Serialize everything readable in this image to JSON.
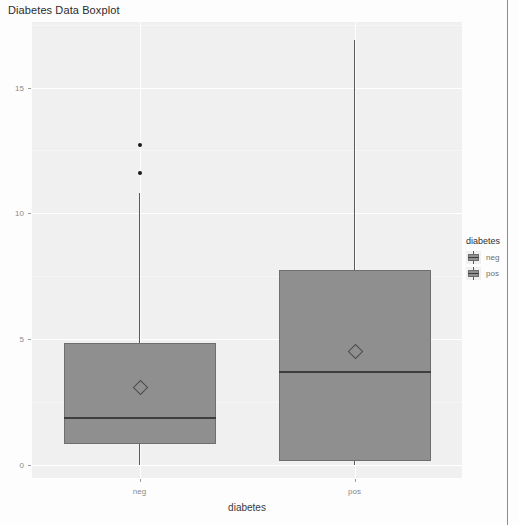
{
  "chart_data": {
    "type": "box",
    "title": "Diabetes Data Boxplot",
    "xlabel": "diabetes",
    "ylabel": "",
    "categories": [
      "neg",
      "pos"
    ],
    "ylim": [
      -0.5,
      17.6
    ],
    "yticks": [
      0,
      5,
      10,
      15
    ],
    "ytick_labels": [
      "0",
      "5",
      "10",
      "15"
    ],
    "grid": true,
    "legend": {
      "title": "diabetes",
      "position": "right",
      "entries": [
        {
          "label": "neg",
          "color": "#8f8f8f"
        },
        {
          "label": "pos",
          "color": "#8f8f8f"
        }
      ]
    },
    "series": [
      {
        "name": "neg",
        "whisker_low": 0.0,
        "q1": 0.86,
        "median": 1.9,
        "mean": 3.15,
        "q3": 4.85,
        "whisker_high": 10.8,
        "outliers": [
          11.6,
          12.7
        ]
      },
      {
        "name": "pos",
        "whisker_low": 0.0,
        "q1": 0.17,
        "median": 3.7,
        "mean": 4.55,
        "q3": 7.75,
        "whisker_high": 16.9,
        "outliers": []
      }
    ],
    "colors": {
      "box_fill": "#8f8f8f",
      "box_border": "#6e6e6e",
      "median": "#3d3d3d",
      "whisker": "#5a5a5a",
      "outlier": "#1b1b1b",
      "panel_background": "#f0f0f0",
      "gridline": "#ffffff"
    }
  }
}
